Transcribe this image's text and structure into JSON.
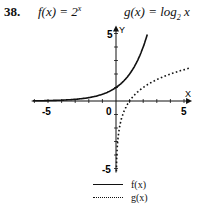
{
  "problem": {
    "number": "38.",
    "f_label": "f(x) = 2^x",
    "f_text": "f(x) = 2",
    "f_exp": "x",
    "g_text": "g(x) = log",
    "g_sub": "2",
    "g_tail": " x"
  },
  "axes": {
    "x_label": "X",
    "y_label": "Y",
    "x_ticks": [
      "-5",
      "0",
      "5"
    ],
    "y_ticks": [
      "5",
      "-5"
    ]
  },
  "legend": {
    "items": [
      {
        "label": "f(x)",
        "style": "solid"
      },
      {
        "label": "g(x)",
        "style": "dotted"
      }
    ]
  },
  "chart_data": {
    "type": "line",
    "title": "",
    "xlabel": "X",
    "ylabel": "Y",
    "xlim": [
      -6,
      5.2
    ],
    "ylim": [
      -5.2,
      5.2
    ],
    "grid": false,
    "legend_position": "bottom-right",
    "x_tick_labels": [
      "-5",
      "0",
      "5"
    ],
    "y_tick_labels": [
      "5",
      "-5"
    ],
    "series": [
      {
        "name": "f(x)",
        "expression": "2^x",
        "style": "solid",
        "x": [
          -5,
          -4,
          -3,
          -2,
          -1,
          0,
          1,
          2,
          2.32
        ],
        "y": [
          0.03,
          0.06,
          0.13,
          0.25,
          0.5,
          1,
          2,
          4,
          5
        ]
      },
      {
        "name": "g(x)",
        "expression": "log2(x)",
        "style": "dotted",
        "x": [
          0.03,
          0.06,
          0.13,
          0.25,
          0.5,
          1,
          2,
          4,
          5
        ],
        "y": [
          -5,
          -4,
          -3,
          -2,
          -1,
          0,
          1,
          2,
          2.32
        ]
      }
    ]
  }
}
